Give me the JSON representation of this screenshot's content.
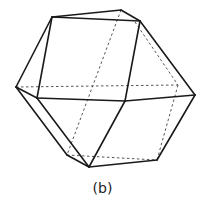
{
  "figure": {
    "caption": "(b)",
    "shape": "cuboctahedron-like polyhedron wireframe",
    "colors": {
      "solid_edge": "#1a1a1a",
      "hidden_edge": "#555555",
      "background": "#ffffff"
    },
    "vertices": {
      "A": [
        52,
        17
      ],
      "B": [
        121,
        10
      ],
      "C": [
        140,
        21
      ],
      "D": [
        16,
        87
      ],
      "E": [
        37,
        98
      ],
      "F": [
        125,
        101
      ],
      "G": [
        195,
        95
      ],
      "H": [
        178,
        85
      ],
      "I": [
        67,
        155
      ],
      "J": [
        89,
        167
      ],
      "K": [
        157,
        160
      ]
    },
    "solid_edges": [
      [
        "A",
        "B"
      ],
      [
        "B",
        "C"
      ],
      [
        "A",
        "C"
      ],
      [
        "A",
        "E"
      ],
      [
        "C",
        "F"
      ],
      [
        "A",
        "D"
      ],
      [
        "D",
        "E"
      ],
      [
        "E",
        "F"
      ],
      [
        "F",
        "G"
      ],
      [
        "C",
        "G"
      ],
      [
        "D",
        "I"
      ],
      [
        "I",
        "J"
      ],
      [
        "E",
        "J"
      ],
      [
        "F",
        "J"
      ],
      [
        "J",
        "K"
      ],
      [
        "G",
        "K"
      ]
    ],
    "hidden_edges": [
      [
        "D",
        "H"
      ],
      [
        "B",
        "I"
      ],
      [
        "C",
        "H"
      ],
      [
        "H",
        "K"
      ],
      [
        "I",
        "K"
      ]
    ]
  }
}
